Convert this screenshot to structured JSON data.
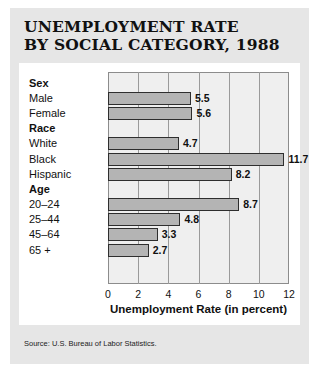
{
  "title": {
    "line1": "UNEMPLOYMENT RATE",
    "line2": "BY SOCIAL CATEGORY, 1988"
  },
  "source": "Source: U.S. Bureau of Labor Statistics.",
  "colors": {
    "panel_background": "#e6e6e6",
    "card_background": "#ffffff",
    "plot_background": "#efefef",
    "bar_fill": "#b4b4b4",
    "bar_border": "#2e2e2e",
    "gridline": "#9a9a9a",
    "text": "#111111"
  },
  "chart_data": {
    "type": "bar",
    "orientation": "horizontal",
    "title": "UNEMPLOYMENT RATE BY SOCIAL CATEGORY, 1988",
    "xlabel": "Unemployment Rate (in percent)",
    "ylabel": "",
    "xlim": [
      0,
      12
    ],
    "xticks": [
      0,
      2,
      4,
      6,
      8,
      10,
      12
    ],
    "xtick_labels": [
      "0",
      "2",
      "4",
      "6",
      "8",
      "10",
      "12"
    ],
    "grid": true,
    "grid_axis": "x",
    "legend": false,
    "groups": [
      {
        "name": "Sex",
        "categories": [
          "Male",
          "Female"
        ],
        "values": [
          5.5,
          5.6
        ],
        "value_labels": [
          "5.5",
          "5.6"
        ]
      },
      {
        "name": "Race",
        "categories": [
          "White",
          "Black",
          "Hispanic"
        ],
        "values": [
          4.7,
          11.7,
          8.2
        ],
        "value_labels": [
          "4.7",
          "11.7",
          "8.2"
        ]
      },
      {
        "name": "Age",
        "categories": [
          "20–24",
          "25–44",
          "45–64",
          "65 +"
        ],
        "values": [
          8.7,
          4.8,
          3.3,
          2.7
        ],
        "value_labels": [
          "8.7",
          "4.8",
          "3.3",
          "2.7"
        ]
      }
    ],
    "categories": [
      "Male",
      "Female",
      "White",
      "Black",
      "Hispanic",
      "20–24",
      "25–44",
      "45–64",
      "65 +"
    ],
    "values": [
      5.5,
      5.6,
      4.7,
      11.7,
      8.2,
      8.7,
      4.8,
      3.3,
      2.7
    ]
  }
}
